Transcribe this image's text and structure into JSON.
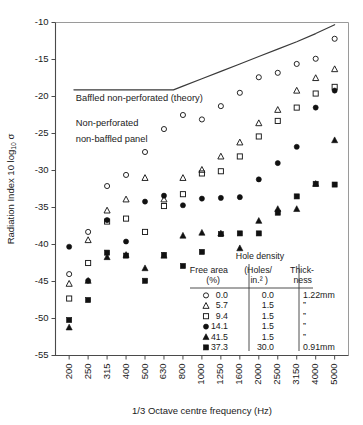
{
  "chart_data": {
    "type": "scatter",
    "title": "",
    "xlabel": "1/3 Octave centre frequency (Hz)",
    "ylabel": "Radiation Index 10 log₁₀ σ",
    "xlim_index": [
      0,
      14
    ],
    "ylim": [
      -55,
      -10
    ],
    "ytick_values": [
      -10,
      -15,
      -20,
      -25,
      -30,
      -35,
      -40,
      -45,
      -50,
      -55
    ],
    "ytick_labels": [
      "-10",
      "-15",
      "-20",
      "-25",
      "-30",
      "-35",
      "-40",
      "-45",
      "-50",
      "-55"
    ],
    "categories": [
      "200",
      "250",
      "315",
      "400",
      "500",
      "630",
      "800",
      "1000",
      "1250",
      "1600",
      "2000",
      "2500",
      "3150",
      "4000",
      "5000"
    ],
    "grid": false,
    "legend_position": "inside-bottom-right",
    "annotations": [
      {
        "text": "Baffled non-perforated (theory)",
        "x_index": 0.35,
        "y": -20.6
      },
      {
        "text": "Non-perforated",
        "x_index": 0.35,
        "y": -24.0
      },
      {
        "text": "non-baffled panel",
        "x_index": 0.35,
        "y": -26.1
      }
    ],
    "theory_curve": {
      "name": "Baffled non-perforated (theory)",
      "points": [
        {
          "x_index": 0.25,
          "y": -19.1
        },
        {
          "x_index": 5.5,
          "y": -19.1
        },
        {
          "x_index": 6.0,
          "y": -18.6
        },
        {
          "x_index": 7.0,
          "y": -17.6
        },
        {
          "x_index": 8.0,
          "y": -16.6
        },
        {
          "x_index": 9.0,
          "y": -15.6
        },
        {
          "x_index": 10.0,
          "y": -14.6
        },
        {
          "x_index": 11.0,
          "y": -13.6
        },
        {
          "x_index": 12.0,
          "y": -12.6
        },
        {
          "x_index": 13.0,
          "y": -11.5
        },
        {
          "x_index": 14.0,
          "y": -10.3
        }
      ]
    },
    "series": [
      {
        "name": "0.0",
        "marker": "open-circle",
        "free_area_pct": "0.0",
        "hole_density": "0.0",
        "thickness": "1.22mm",
        "values": [
          -44.0,
          -38.3,
          -32.1,
          -30.6,
          -27.5,
          -24.4,
          -22.5,
          -23.1,
          -21.3,
          -19.5,
          -17.4,
          -16.8,
          -15.6,
          -14.9,
          -12.2
        ]
      },
      {
        "name": "5.7",
        "marker": "open-triangle",
        "free_area_pct": "5.7",
        "hole_density": "1.5",
        "thickness": "”",
        "values": [
          -45.3,
          -39.4,
          -35.4,
          -33.9,
          -31.0,
          -33.9,
          -31.0,
          -29.9,
          -28.1,
          -26.2,
          -23.6,
          -21.8,
          -19.2,
          -17.5,
          -16.3
        ]
      },
      {
        "name": "9.4",
        "marker": "open-square",
        "free_area_pct": "9.4",
        "hole_density": "1.5",
        "thickness": "”",
        "values": [
          -47.3,
          -42.5,
          -36.9,
          -36.5,
          -38.3,
          -34.8,
          -33.2,
          -30.4,
          -30.1,
          -28.1,
          -25.4,
          -23.3,
          -21.5,
          -19.6,
          -18.7
        ]
      },
      {
        "name": "14.1",
        "marker": "filled-circle",
        "free_area_pct": "14.1",
        "hole_density": "1.5",
        "thickness": "”",
        "values": [
          -40.3,
          -44.9,
          -36.7,
          -39.6,
          -34.2,
          -33.4,
          -34.7,
          -33.8,
          -33.7,
          -33.6,
          -31.2,
          -29.0,
          -26.8,
          -21.5,
          -19.2
        ]
      },
      {
        "name": "41.5",
        "marker": "filled-triangle",
        "free_area_pct": "41.5",
        "hole_density": "1.5",
        "thickness": "”",
        "values": [
          -51.2,
          -44.9,
          -41.7,
          -41.4,
          -43.2,
          -41.5,
          -38.8,
          -38.4,
          -38.5,
          -40.5,
          -36.8,
          -35.2,
          -35.2,
          -31.8,
          -25.9
        ]
      },
      {
        "name": "37.3",
        "marker": "filled-square",
        "free_area_pct": "37.3",
        "hole_density": "30.0",
        "thickness": "0.91mm",
        "values": [
          -50.2,
          -47.5,
          -41.1,
          -41.5,
          -44.9,
          -41.4,
          -42.9,
          -41.0,
          -38.6,
          -38.5,
          -38.5,
          -35.7,
          -33.5,
          -31.8,
          -31.9
        ]
      }
    ]
  },
  "legend": {
    "title": "Hole density",
    "headers": {
      "col1_line1": "Free area",
      "col1_line2": "(%)",
      "col2_line1": "(Holes/",
      "col2_line2": "in.² )",
      "col3_line1": "Thick-",
      "col3_line2": "ness"
    },
    "rows": [
      {
        "marker": "open-circle",
        "free_area": "0.0",
        "density": "0.0",
        "thickness": "1.22mm"
      },
      {
        "marker": "open-triangle",
        "free_area": "5.7",
        "density": "1.5",
        "thickness": "”"
      },
      {
        "marker": "open-square",
        "free_area": "9.4",
        "density": "1.5",
        "thickness": "”"
      },
      {
        "marker": "filled-circle",
        "free_area": "14.1",
        "density": "1.5",
        "thickness": "”"
      },
      {
        "marker": "filled-triangle",
        "free_area": "41.5",
        "density": "1.5",
        "thickness": "”"
      },
      {
        "marker": "filled-square",
        "free_area": "37.3",
        "density": "30.0",
        "thickness": "0.91mm"
      }
    ]
  },
  "colors": {
    "ink": "#1a1a1a",
    "axis": "#4a4a4a",
    "box": "#9a9a9a",
    "curve": "#3a3a3a",
    "background": "#ffffff"
  }
}
